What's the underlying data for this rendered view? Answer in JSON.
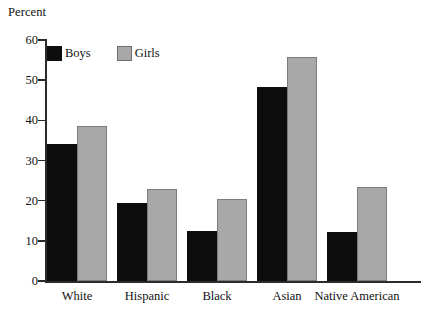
{
  "chart_data": {
    "type": "bar",
    "title": "",
    "ylabel": "Percent",
    "xlabel": "",
    "categories": [
      "White",
      "Hispanic",
      "Black",
      "Asian",
      "Native American"
    ],
    "series": [
      {
        "name": "Boys",
        "color": "#0d0d0d",
        "values": [
          34,
          19.4,
          12.4,
          48.4,
          12.2
        ]
      },
      {
        "name": "Girls",
        "color": "#a8a8a8",
        "values": [
          38.6,
          22.8,
          20.5,
          55.8,
          23.4
        ]
      }
    ],
    "ylim": [
      0,
      60
    ],
    "yticks": [
      0,
      10,
      20,
      30,
      40,
      50,
      60
    ],
    "ytick_labels": [
      "0",
      "10",
      "20",
      "30",
      "40",
      "50",
      "60"
    ],
    "grid": false,
    "legend_position": "top-left-inside"
  },
  "legend": {
    "items": [
      {
        "label": "Boys",
        "swatch": "black-square-swatch"
      },
      {
        "label": "Girls",
        "swatch": "gray-square-swatch"
      }
    ]
  }
}
